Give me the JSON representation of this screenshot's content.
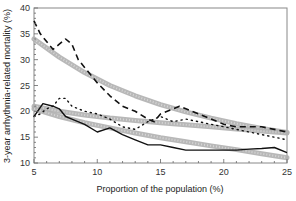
{
  "chart_data": {
    "type": "line",
    "title": "",
    "xlabel": "Proportion of the population (%)",
    "ylabel": "3-year arrhythmia-related mortality (%)",
    "xlim": [
      5,
      25
    ],
    "ylim": [
      10,
      40
    ],
    "xticks": [
      5,
      10,
      15,
      20,
      25
    ],
    "yticks": [
      10,
      15,
      20,
      25,
      30,
      35,
      40
    ],
    "grid": false,
    "legend": "none",
    "series": [
      {
        "name": "dashed-observed",
        "style": "dashed",
        "color": "#111111",
        "x": [
          5,
          5.5,
          6,
          6.5,
          7,
          7.5,
          8,
          8.5,
          9,
          10,
          11,
          12,
          13,
          14,
          14.5,
          15,
          16,
          16.5,
          17,
          18,
          19,
          20,
          21,
          22,
          23,
          24,
          25
        ],
        "y": [
          37.5,
          35,
          33.5,
          32,
          33,
          34,
          33,
          30,
          28.5,
          25.5,
          23,
          21,
          20,
          18.5,
          18,
          19.5,
          20.5,
          21,
          20.5,
          19.5,
          18.5,
          17.5,
          17,
          17,
          17,
          16.5,
          16
        ]
      },
      {
        "name": "dotted-observed",
        "style": "dotted",
        "color": "#111111",
        "x": [
          5,
          5.5,
          6,
          6.5,
          7,
          7.5,
          8,
          9,
          10,
          11,
          12,
          13,
          14,
          15,
          16,
          17,
          18,
          19,
          20,
          21,
          22,
          23,
          24,
          25
        ],
        "y": [
          19,
          19.5,
          20.5,
          21,
          22.5,
          22.5,
          21,
          20,
          19.5,
          18.5,
          17,
          16.5,
          18,
          19,
          18,
          18.5,
          18,
          17.5,
          17,
          16.5,
          16,
          15.5,
          15,
          14.5
        ]
      },
      {
        "name": "solid-observed",
        "style": "solid",
        "color": "#111111",
        "x": [
          5,
          5.7,
          6.5,
          7,
          7.5,
          8,
          9,
          10,
          11,
          12,
          13,
          14,
          15,
          16,
          17,
          18,
          19,
          20,
          21,
          22,
          23,
          24,
          25
        ],
        "y": [
          19,
          21.5,
          21,
          20.5,
          19,
          18.5,
          17.5,
          16,
          16.8,
          15.5,
          14.5,
          13.5,
          13.5,
          13,
          12.5,
          12.5,
          12.5,
          12.5,
          12.5,
          12.7,
          12.8,
          13,
          12
        ]
      },
      {
        "name": "upper-fit",
        "style": "band",
        "color": "#b0b0b0",
        "x": [
          5,
          7,
          9,
          11,
          13,
          15,
          17,
          19,
          21,
          23,
          25
        ],
        "y": [
          34,
          30.5,
          27.5,
          25,
          23,
          21.3,
          19.9,
          18.7,
          17.6,
          16.7,
          15.9
        ]
      },
      {
        "name": "middle-fit",
        "style": "band",
        "color": "#b0b0b0",
        "x": [
          5,
          7,
          9,
          11,
          13,
          15,
          17,
          19,
          21,
          23,
          25
        ],
        "y": [
          21,
          20,
          19.3,
          18.7,
          18.2,
          17.8,
          17.4,
          17,
          16.6,
          16.2,
          15.8
        ]
      },
      {
        "name": "lower-fit",
        "style": "band",
        "color": "#b0b0b0",
        "x": [
          5,
          7,
          9,
          11,
          13,
          15,
          17,
          19,
          21,
          23,
          25
        ],
        "y": [
          20.5,
          19,
          17.8,
          16.8,
          15.8,
          14.9,
          14.1,
          13.3,
          12.6,
          11.8,
          11
        ]
      }
    ]
  }
}
